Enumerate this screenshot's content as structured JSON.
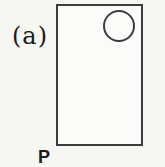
{
  "figure": {
    "panel_label": "(a)",
    "point_label": "P"
  },
  "colors": {
    "background": "#f6f6f3",
    "line": "#3d3d3d",
    "text": "#1c1c1c"
  }
}
